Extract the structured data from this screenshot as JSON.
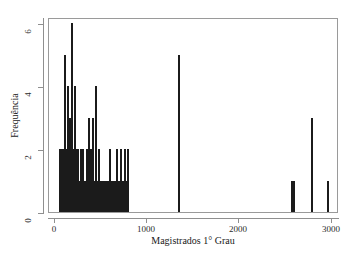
{
  "chart_data": {
    "type": "bar",
    "title": "",
    "xlabel": "Magistrados 1° Grau",
    "ylabel": "Frequência",
    "xlim": [
      -60,
      3080
    ],
    "ylim": [
      0,
      6.2
    ],
    "xticks": [
      0,
      1000,
      2000,
      3000
    ],
    "xtick_labels": [
      "0",
      "1000",
      "2000",
      "3000"
    ],
    "yticks": [
      0,
      2,
      4,
      6
    ],
    "ytick_labels": [
      "0",
      "2",
      "4",
      "6"
    ],
    "grid": false,
    "legend": null,
    "bar_color": "#1b1b1b",
    "frame_color": "#9a9a9a",
    "x": [
      55,
      68,
      76,
      84,
      92,
      100,
      108,
      116,
      124,
      132,
      140,
      148,
      156,
      164,
      172,
      180,
      188,
      196,
      204,
      212,
      220,
      228,
      236,
      244,
      252,
      262,
      272,
      282,
      292,
      302,
      312,
      322,
      332,
      342,
      352,
      362,
      372,
      382,
      392,
      402,
      412,
      425,
      438,
      452,
      466,
      480,
      494,
      508,
      522,
      536,
      560,
      580,
      600,
      612,
      624,
      640,
      656,
      672,
      688,
      704,
      716,
      728,
      740,
      752,
      764,
      776,
      788,
      800,
      1350,
      2570,
      2592,
      2790,
      2960
    ],
    "values": [
      2,
      1,
      2,
      1,
      1,
      2,
      5,
      1,
      2,
      1,
      1,
      4,
      1,
      2,
      3,
      1,
      6,
      2,
      1,
      1,
      4,
      1,
      2,
      1,
      2,
      1,
      1,
      2,
      1,
      1,
      2,
      1,
      1,
      1,
      2,
      1,
      3,
      1,
      2,
      1,
      3,
      1,
      1,
      4,
      1,
      2,
      1,
      1,
      1,
      1,
      1,
      1,
      2,
      1,
      1,
      1,
      1,
      2,
      1,
      1,
      2,
      1,
      1,
      1,
      2,
      1,
      1,
      2,
      5,
      1,
      1,
      3,
      1
    ]
  },
  "axes": {
    "x_title": "Magistrados 1° Grau",
    "y_title": "Frequência"
  }
}
